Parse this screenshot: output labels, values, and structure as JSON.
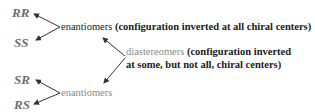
{
  "stereoisomers": [
    {
      "label": "RR"
    },
    {
      "label": "SS"
    },
    {
      "label": "SR"
    },
    {
      "label": "RS"
    }
  ],
  "relations": {
    "top_enantiomers": {
      "term": "enantiomers",
      "description": "(configuration inverted at all chiral centers)"
    },
    "diastereomers": {
      "term": "diastereomers",
      "description_line1": "(configuration inverted",
      "description_line2": "at some, but not all, chiral centers)"
    },
    "bottom_enantiomers": {
      "term": "enantiomers"
    }
  },
  "colors": {
    "label": "#6e6e6e",
    "term_dark": "#1a1a1a",
    "term_gray": "#8a8a8a",
    "arrow": "#333333"
  }
}
